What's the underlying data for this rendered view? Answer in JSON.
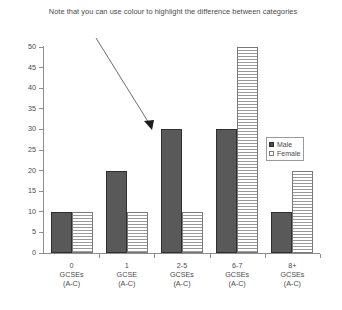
{
  "chart_data": {
    "type": "bar",
    "title": "Note that you can use colour to highlight the difference between categories",
    "xlabel": "",
    "ylabel": "",
    "ylim": [
      0,
      50
    ],
    "yticks": [
      0,
      5,
      10,
      15,
      20,
      25,
      30,
      35,
      40,
      45,
      50
    ],
    "ytick_labels": [
      "0",
      "5",
      "10",
      "15",
      "20",
      "25",
      "30",
      "35",
      "40",
      "45",
      "50"
    ],
    "grid": false,
    "legend_position": "right-middle",
    "categories": [
      "0\nGCSEs\n(A-C)",
      "1\nGCSE\n(A-C)",
      "2-5\nGCSEs\n(A-C)",
      "6-7\nGCSEs\n(A-C)",
      "8+\nGCSEs\n(A-C)"
    ],
    "category_lines": [
      [
        "0",
        "GCSEs",
        "(A-C)"
      ],
      [
        "1",
        "GCSE",
        "(A-C)"
      ],
      [
        "2-5",
        "GCSEs",
        "(A-C)"
      ],
      [
        "6-7",
        "GCSEs",
        "(A-C)"
      ],
      [
        "8+",
        "GCSEs",
        "(A-C)"
      ]
    ],
    "series": [
      {
        "name": "Male",
        "values": [
          10,
          20,
          30,
          30,
          10
        ],
        "color": "#595959"
      },
      {
        "name": "Female",
        "values": [
          10,
          10,
          10,
          50,
          20
        ],
        "color": "#ffffff"
      }
    ],
    "annotations": [
      {
        "type": "arrow",
        "text": "",
        "points_to_series": "Male",
        "points_to_category": "2-5\nGCSEs\n(A-C)"
      }
    ]
  },
  "legend": {
    "items": [
      {
        "label": "Male"
      },
      {
        "label": "Female"
      }
    ]
  }
}
